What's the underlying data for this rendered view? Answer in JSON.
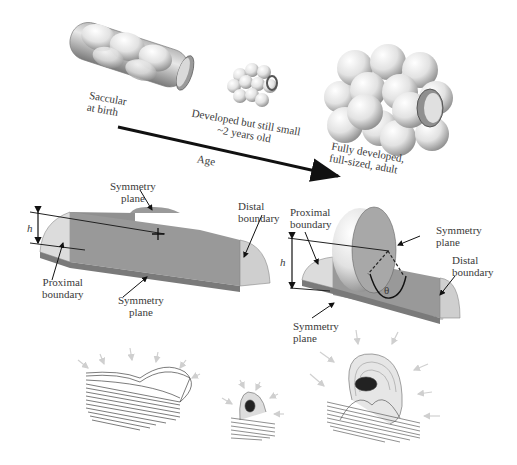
{
  "top_panel": {
    "stages": [
      {
        "label_line1": "Saccular",
        "label_line2": "at birth"
      },
      {
        "label_line1": "Developed but still small",
        "label_line2": "~2 years old"
      },
      {
        "label_line1": "Fully developed,",
        "label_line2": "full-sized, adult"
      }
    ],
    "axis_label": "Age"
  },
  "middle_panel": {
    "left_model": {
      "height_symbol": "h",
      "symmetry_plane_top": {
        "line1": "Symmetry",
        "line2": "plane"
      },
      "distal": {
        "line1": "Distal",
        "line2": "boundary"
      },
      "proximal": {
        "line1": "Proximal",
        "line2": "boundary"
      },
      "symmetry_plane_bottom": {
        "line1": "Symmetry",
        "line2": "plane"
      }
    },
    "right_model": {
      "height_symbol": "h",
      "angle_symbol": "θ",
      "proximal": {
        "line1": "Proximal",
        "line2": "boundary"
      },
      "symmetry_plane_side": {
        "line1": "Symmetry",
        "line2": "plane"
      },
      "distal": {
        "line1": "Distal",
        "line2": "boundary"
      },
      "symmetry_plane_bottom": {
        "line1": "Symmetry",
        "line2": "plane"
      }
    }
  },
  "colors": {
    "surface_dark": "#8a8a8a",
    "surface_mid": "#a8a8a8",
    "surface_light": "#d4d4d4",
    "arrow": "#111111",
    "ghost_arrow": "#d0d0d0"
  }
}
